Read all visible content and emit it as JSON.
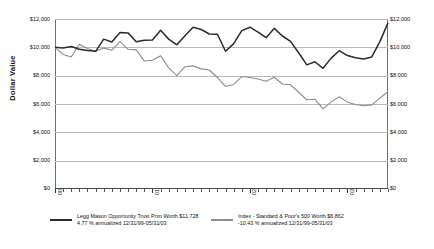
{
  "axes": {
    "y_title": "Dollar Value",
    "y_ticks": [
      "$12,000",
      "$10,000",
      "$8,000",
      "$6,000",
      "$4,000",
      "$2,000",
      "$0"
    ],
    "x_ticks": [
      "00",
      "01",
      "02",
      "03"
    ]
  },
  "legend": {
    "series1": {
      "line1": "Legg Mason Opportunity Trust Prim Worth $11,728",
      "line2": "4.77 % annualized 12/31/99-05/31/03",
      "color": "#2b2b2b"
    },
    "series2": {
      "line1": "Index - Standard & Poor's 500 Worth $6,862",
      "line2": "-10.43 % annualized 12/31/99-05/31/03",
      "color": "#8d8d8d"
    }
  },
  "chart_data": {
    "type": "line",
    "title": "",
    "xlabel": "",
    "ylabel": "Dollar Value",
    "ylim": [
      0,
      12000
    ],
    "ytick_values": [
      12000,
      10000,
      8000,
      6000,
      4000,
      2000,
      0
    ],
    "grid": true,
    "legend_position": "bottom",
    "x": [
      "12/99",
      "01/00",
      "02/00",
      "03/00",
      "04/00",
      "05/00",
      "06/00",
      "07/00",
      "08/00",
      "09/00",
      "10/00",
      "11/00",
      "12/00",
      "01/01",
      "02/01",
      "03/01",
      "04/01",
      "05/01",
      "06/01",
      "07/01",
      "08/01",
      "09/01",
      "10/01",
      "11/01",
      "12/01",
      "01/02",
      "02/02",
      "03/02",
      "04/02",
      "05/02",
      "06/02",
      "07/02",
      "08/02",
      "09/02",
      "10/02",
      "11/02",
      "12/02",
      "01/03",
      "02/03",
      "03/03",
      "04/03",
      "05/03"
    ],
    "xtick_labels": [
      "00",
      "01",
      "02",
      "03"
    ],
    "xtick_positions": [
      0,
      12,
      24,
      36
    ],
    "series": [
      {
        "name": "Legg Mason Opportunity Trust Prim",
        "color": "#2b2b2b",
        "final_value": 11728,
        "annualized": "4.77 %",
        "period": "12/31/99-05/31/03",
        "values": [
          10000,
          9950,
          10060,
          9870,
          9780,
          9720,
          10580,
          10380,
          11050,
          11020,
          10400,
          10500,
          10520,
          11200,
          10580,
          10180,
          10820,
          11420,
          11260,
          10940,
          10920,
          9720,
          10260,
          11180,
          11420,
          11080,
          10680,
          11340,
          10800,
          10420,
          9620,
          8760,
          8980,
          8520,
          9240,
          9760,
          9420,
          9260,
          9180,
          9320,
          10400,
          11728
        ]
      },
      {
        "name": "Index - Standard & Poor's 500",
        "color": "#8d8d8d",
        "final_value": 6862,
        "annualized": "-10.43 %",
        "period": "12/31/99-05/31/03",
        "values": [
          10000,
          9500,
          9320,
          10220,
          9920,
          9720,
          9960,
          9800,
          10410,
          9860,
          9820,
          9040,
          9090,
          9410,
          8550,
          8010,
          8630,
          8690,
          8480,
          8400,
          7870,
          7240,
          7380,
          7940,
          7870,
          7760,
          7610,
          7890,
          7410,
          7360,
          6830,
          6300,
          6340,
          5650,
          6150,
          6510,
          6130,
          5970,
          5880,
          5940,
          6420,
          6862
        ]
      }
    ]
  }
}
